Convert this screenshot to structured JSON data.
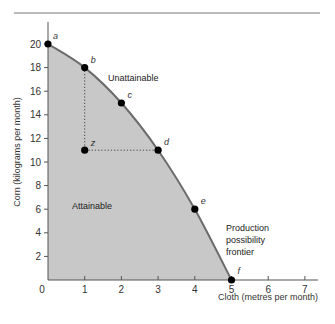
{
  "chart_data": {
    "type": "line",
    "title": "",
    "xlabel": "Cloth (metres per month)",
    "ylabel": "Corn (kilograms per month)",
    "xlim": [
      0,
      7
    ],
    "ylim": [
      0,
      21
    ],
    "x_ticks": [
      "0",
      "1",
      "2",
      "3",
      "4",
      "5",
      "6",
      "7"
    ],
    "y_ticks": [
      "2",
      "4",
      "6",
      "8",
      "10",
      "12",
      "14",
      "16",
      "18",
      "20"
    ],
    "grid": false,
    "series": [
      {
        "name": "Production possibility frontier",
        "points": [
          {
            "label": "a",
            "x": 0,
            "y": 20
          },
          {
            "label": "b",
            "x": 1,
            "y": 18
          },
          {
            "label": "c",
            "x": 2,
            "y": 15
          },
          {
            "label": "d",
            "x": 3,
            "y": 11
          },
          {
            "label": "e",
            "x": 4,
            "y": 6
          },
          {
            "label": "f",
            "x": 5,
            "y": 0
          }
        ]
      },
      {
        "name": "Inefficient point",
        "points": [
          {
            "label": "z",
            "x": 1,
            "y": 11
          }
        ]
      }
    ],
    "annotations": [
      {
        "text": "Unattainable"
      },
      {
        "text": "Attainable"
      },
      {
        "text": "Production possibility frontier",
        "lines": [
          "Production",
          "possibility",
          "frontier"
        ]
      }
    ],
    "colors": {
      "fill": "#c8c8c8",
      "curve": "#6b6b6b",
      "point": "#000000",
      "axis": "#555555"
    }
  }
}
